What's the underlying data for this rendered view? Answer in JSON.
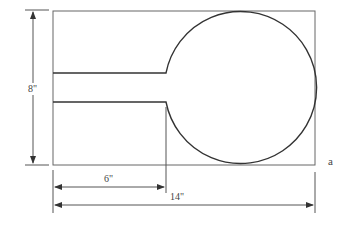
{
  "figure": {
    "label": "a",
    "dimensions": {
      "height": "8\"",
      "stem_length": "6\"",
      "total_length": "14\""
    }
  }
}
